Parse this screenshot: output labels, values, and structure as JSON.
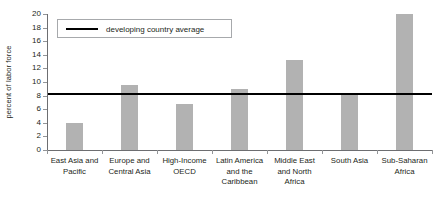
{
  "chart_data": {
    "type": "bar",
    "title": "",
    "xlabel": "",
    "ylabel": "percent of labor force",
    "ylim": [
      0,
      20
    ],
    "ytick_step": 2,
    "ytick_labels": [
      "0",
      "2",
      "4",
      "6",
      "8",
      "10",
      "12",
      "14",
      "16",
      "18",
      "20"
    ],
    "grid": false,
    "legend_position": "top-left",
    "categories": [
      "East Asia and Pacific",
      "Europe and Central Asia",
      "High-Income OECD",
      "Latin America and the Caribbean",
      "Middle East and North Africa",
      "South Asia",
      "Sub-Saharan Africa"
    ],
    "values": [
      4.0,
      9.6,
      6.8,
      9.0,
      13.2,
      8.2,
      20.0
    ],
    "reference_line": {
      "label": "developing country average",
      "value": 8.2,
      "color": "#000000"
    },
    "bar_color": "#b2b2b2",
    "axis_color": "#6d6e71"
  },
  "legend": {
    "label": "developing country average"
  },
  "axes": {
    "y_title": "percent of labor force"
  }
}
